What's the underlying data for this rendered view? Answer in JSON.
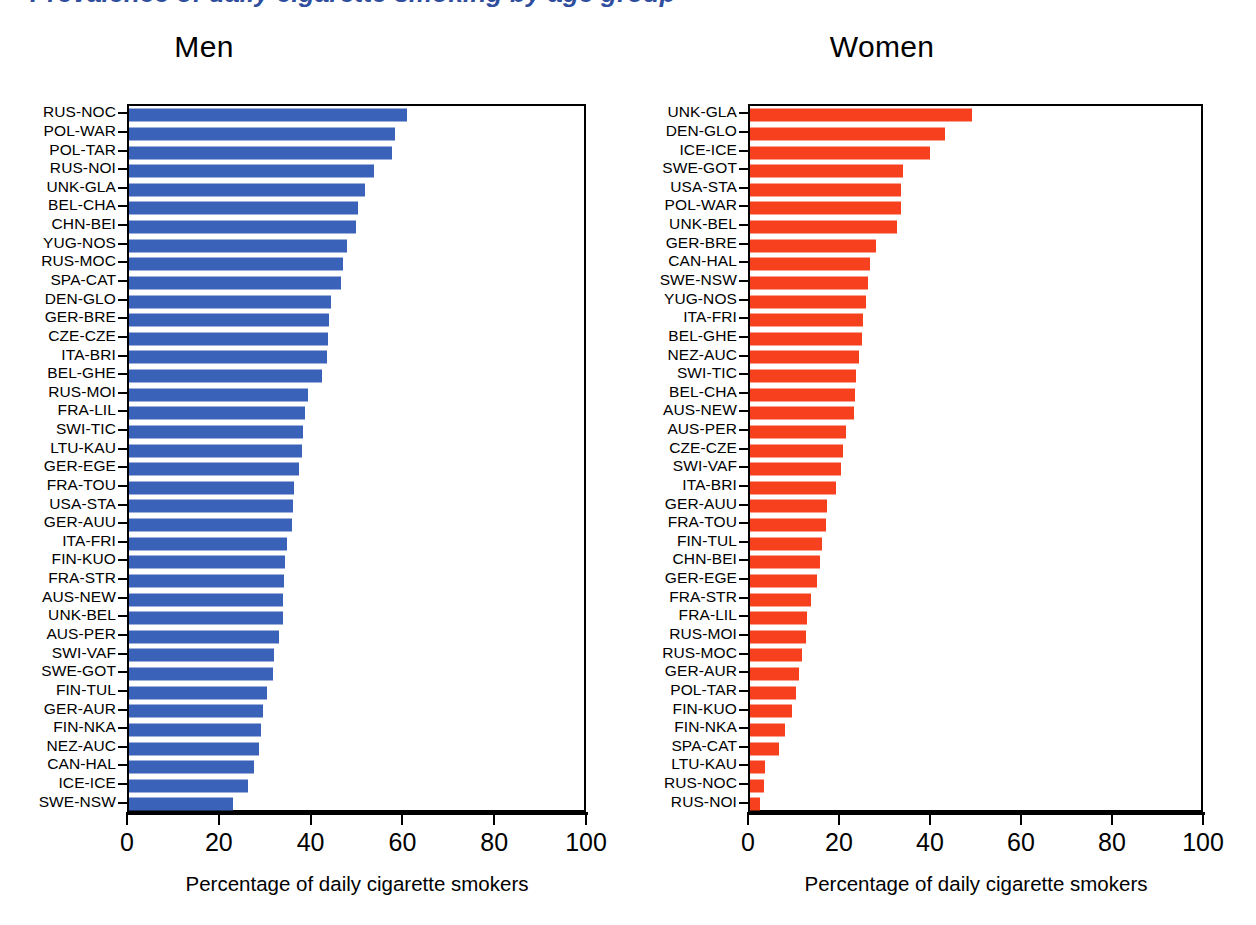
{
  "figure": {
    "cut_off_heading": "Prevalence of daily cigarette smoking by age group",
    "axis_title": "Percentage of daily cigarette smokers",
    "x_ticks": [
      "0",
      "20",
      "40",
      "60",
      "80",
      "100"
    ],
    "colors": {
      "men_bar": "#3a62b8",
      "women_bar": "#f7411e",
      "heading": "#2f4e9e"
    }
  },
  "panels": {
    "men": {
      "title": "Men"
    },
    "women": {
      "title": "Women"
    }
  },
  "chart_data": [
    {
      "type": "bar",
      "title": "Men",
      "orientation": "horizontal",
      "xlabel": "Percentage of daily cigarette smokers",
      "ylabel": "",
      "xlim": [
        0,
        100
      ],
      "xticks": [
        0,
        20,
        40,
        60,
        80,
        100
      ],
      "grid": false,
      "legend": "none",
      "color": "#3a62b8",
      "categories": [
        "RUS-NOC",
        "POL-WAR",
        "POL-TAR",
        "RUS-NOI",
        "UNK-GLA",
        "BEL-CHA",
        "CHN-BEI",
        "YUG-NOS",
        "RUS-MOC",
        "SPA-CAT",
        "DEN-GLO",
        "GER-BRE",
        "CZE-CZE",
        "ITA-BRI",
        "BEL-GHE",
        "RUS-MOI",
        "FRA-LIL",
        "SWI-TIC",
        "LTU-KAU",
        "GER-EGE",
        "FRA-TOU",
        "USA-STA",
        "GER-AUU",
        "ITA-FRI",
        "FIN-KUO",
        "FRA-STR",
        "AUS-NEW",
        "UNK-BEL",
        "AUS-PER",
        "SWI-VAF",
        "SWE-GOT",
        "FIN-TUL",
        "GER-AUR",
        "FIN-NKA",
        "NEZ-AUC",
        "CAN-HAL",
        "ICE-ICE",
        "SWE-NSW"
      ],
      "values": [
        60.6,
        58.0,
        57.2,
        53.4,
        51.4,
        49.8,
        49.4,
        47.4,
        46.6,
        46.2,
        44.0,
        43.6,
        43.4,
        43.2,
        42.0,
        39.0,
        38.4,
        37.8,
        37.6,
        37.0,
        36.0,
        35.8,
        35.6,
        34.4,
        34.0,
        33.8,
        33.6,
        33.6,
        32.6,
        31.6,
        31.4,
        30.0,
        29.2,
        28.8,
        28.4,
        27.2,
        26.0,
        22.7
      ]
    },
    {
      "type": "bar",
      "title": "Women",
      "orientation": "horizontal",
      "xlabel": "Percentage of daily cigarette smokers",
      "ylabel": "",
      "xlim": [
        0,
        100
      ],
      "xticks": [
        0,
        20,
        40,
        60,
        80,
        100
      ],
      "grid": false,
      "legend": "none",
      "color": "#f7411e",
      "categories": [
        "UNK-GLA",
        "DEN-GLO",
        "ICE-ICE",
        "SWE-GOT",
        "USA-STA",
        "POL-WAR",
        "UNK-BEL",
        "GER-BRE",
        "CAN-HAL",
        "SWE-NSW",
        "YUG-NOS",
        "ITA-FRI",
        "BEL-GHE",
        "NEZ-AUC",
        "SWI-TIC",
        "BEL-CHA",
        "AUS-NEW",
        "AUS-PER",
        "CZE-CZE",
        "SWI-VAF",
        "ITA-BRI",
        "GER-AUU",
        "FRA-TOU",
        "FIN-TUL",
        "CHN-BEI",
        "GER-EGE",
        "FRA-STR",
        "FRA-LIL",
        "RUS-MOI",
        "RUS-MOC",
        "GER-AUR",
        "POL-TAR",
        "FIN-KUO",
        "FIN-NKA",
        "SPA-CAT",
        "LTU-KAU",
        "RUS-NOC",
        "RUS-NOI"
      ],
      "values": [
        48.8,
        42.8,
        39.6,
        33.6,
        33.2,
        33.2,
        32.4,
        27.8,
        26.4,
        26.0,
        25.4,
        24.8,
        24.6,
        24.0,
        23.2,
        23.0,
        22.8,
        21.0,
        20.4,
        20.0,
        18.8,
        17.0,
        16.6,
        15.8,
        15.4,
        14.8,
        13.4,
        12.6,
        12.4,
        11.4,
        10.8,
        10.0,
        9.2,
        7.8,
        6.4,
        3.2,
        3.0,
        2.2
      ]
    }
  ]
}
